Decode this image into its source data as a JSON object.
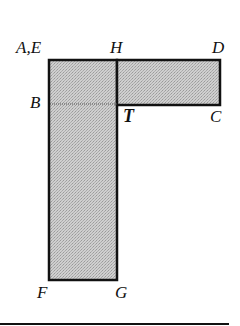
{
  "diagram": {
    "type": "geometric-rectangle-figure",
    "fill_color": "#c8c8c8",
    "stroke_color": "#111111",
    "labels": {
      "top_left": "A,E",
      "top_middle": "H",
      "top_right": "D",
      "left_middle": "B",
      "inner_corner": "T",
      "right_bottom": "C",
      "bottom_left": "F",
      "bottom_right": "G"
    },
    "shapes": [
      {
        "name": "vertical-rectangle",
        "corners": [
          "A,E",
          "H",
          "G",
          "F"
        ]
      },
      {
        "name": "horizontal-rectangle",
        "corners": [
          "H",
          "D",
          "C",
          "T"
        ]
      },
      {
        "name": "dividing-line",
        "from": "B",
        "to": "T",
        "style": "dotted"
      }
    ]
  }
}
